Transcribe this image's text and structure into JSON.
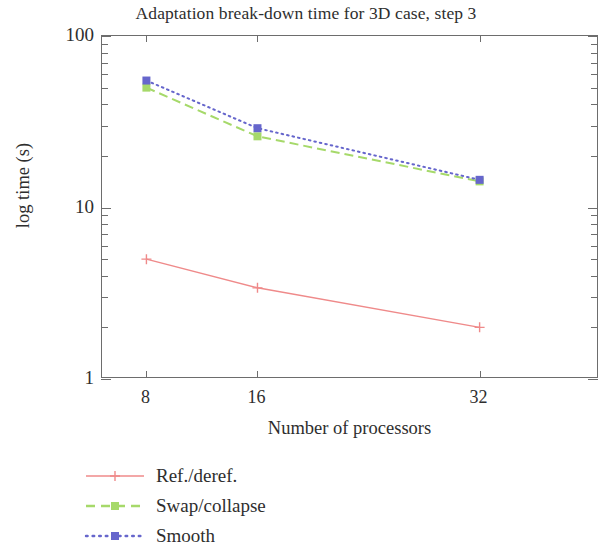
{
  "chart_data": {
    "type": "line",
    "title": "Adaptation break-down time for 3D case, step 3",
    "xlabel": "Number of processors",
    "ylabel": "log time (s)",
    "x": [
      8,
      16,
      32
    ],
    "xtick_labels": [
      "8",
      "16",
      "32"
    ],
    "ytick_labels": [
      "1",
      "10",
      "100"
    ],
    "xscale": "linear",
    "yscale": "log",
    "xlim": [
      4.8,
      40.6
    ],
    "ylim": [
      1,
      100
    ],
    "grid": false,
    "legend_position": "below-left",
    "series": [
      {
        "name": "Ref./deref.",
        "values": [
          5.0,
          3.4,
          2.0
        ],
        "color": "#ef8a8a",
        "linestyle": "solid",
        "marker": "plus"
      },
      {
        "name": "Swap/collapse",
        "values": [
          50,
          26,
          14.2
        ],
        "color": "#a6d96a",
        "linestyle": "dashed",
        "marker": "square"
      },
      {
        "name": "Smooth",
        "values": [
          55,
          29,
          14.5
        ],
        "color": "#6666cc",
        "linestyle": "dotted",
        "marker": "square"
      }
    ]
  },
  "axes": {
    "frame_color": "#6d6d6d",
    "text_color": "#2e2e2e"
  },
  "legend": {
    "items": [
      {
        "label": "Ref./deref."
      },
      {
        "label": "Swap/collapse"
      },
      {
        "label": "Smooth"
      }
    ]
  }
}
